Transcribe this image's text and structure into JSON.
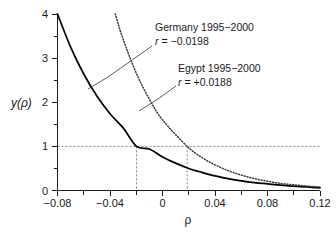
{
  "chart_data": {
    "type": "line",
    "title": "",
    "xlabel": "ρ",
    "ylabel": "y(ρ)",
    "xlim": [
      -0.08,
      0.12
    ],
    "ylim": [
      0,
      4
    ],
    "xticks": [
      -0.08,
      -0.04,
      0,
      0.04,
      0.08,
      0.12
    ],
    "xticklabels": [
      "−0.08",
      "−0.04",
      "0",
      "0.04",
      "0.08",
      "0.12"
    ],
    "yticks": [
      0,
      1,
      2,
      3,
      4
    ],
    "yticklabels": [
      "0",
      "1",
      "2",
      "3",
      "4"
    ],
    "yminorticks": [
      0.5,
      1.5,
      2.5,
      3.5
    ],
    "grid": false,
    "legend_position": "inline-annotations",
    "series": [
      {
        "name": "Germany 1995–2000",
        "style": "solid",
        "r": -0.0198,
        "r_label": "−0.0198",
        "x": [
          -0.08,
          -0.07,
          -0.06,
          -0.05,
          -0.04,
          -0.03,
          -0.0198,
          -0.01,
          0,
          0.01,
          0.02,
          0.03,
          0.04,
          0.05,
          0.06,
          0.07,
          0.08,
          0.09,
          0.1,
          0.11,
          0.12
        ],
        "y": [
          4.0,
          3.25,
          2.64,
          2.14,
          1.74,
          1.42,
          1.0,
          0.94,
          0.76,
          0.62,
          0.5,
          0.41,
          0.33,
          0.27,
          0.22,
          0.18,
          0.15,
          0.12,
          0.1,
          0.08,
          0.06
        ]
      },
      {
        "name": "Egypt 1995–2000",
        "style": "dotted",
        "r": 0.0188,
        "r_label": "+0.0188",
        "x": [
          -0.036,
          -0.03,
          -0.02,
          -0.01,
          0,
          0.0188,
          0.03,
          0.04,
          0.05,
          0.06,
          0.07,
          0.08,
          0.09,
          0.1,
          0.11,
          0.12
        ],
        "y": [
          4.0,
          3.43,
          2.66,
          2.07,
          1.6,
          1.0,
          0.75,
          0.58,
          0.45,
          0.35,
          0.27,
          0.21,
          0.16,
          0.13,
          0.1,
          0.08
        ]
      }
    ],
    "reference_lines": [
      {
        "name": "y-equals-one",
        "orientation": "horizontal",
        "value": 1,
        "style": "dashed"
      },
      {
        "name": "germany-dropline",
        "orientation": "vertical",
        "value": -0.0198,
        "from": 0,
        "to": 1,
        "style": "dashed"
      },
      {
        "name": "egypt-dropline",
        "orientation": "vertical",
        "value": 0.0188,
        "from": 0,
        "to": 1,
        "style": "dashed"
      }
    ],
    "annotations": [
      {
        "name": "germany",
        "line1": "Germany 1995−2000",
        "line2_prefix": "r",
        "line2_value": "= −0.0198"
      },
      {
        "name": "egypt",
        "line1": "Egypt 1995−2000",
        "line2_prefix": "r",
        "line2_value": "= +0.0188"
      }
    ],
    "colors": {
      "solid_curve": "#000000",
      "dotted_curve": "#3b3b3b",
      "guide": "#777777",
      "axis": "#1a1a1a",
      "background": "#ffffff"
    }
  }
}
